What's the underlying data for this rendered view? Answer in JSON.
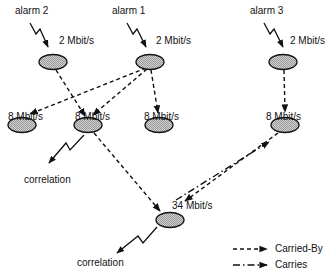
{
  "diagram": {
    "type": "network-alarm-correlation",
    "nodes": [
      {
        "id": "n2a",
        "label": "2 Mbit/s",
        "alarm": "alarm 2",
        "cx": 53,
        "cy": 62
      },
      {
        "id": "n2b",
        "label": "2 Mbit/s",
        "alarm": "alarm 1",
        "cx": 150,
        "cy": 62
      },
      {
        "id": "n2c",
        "label": "2 Mbit/s",
        "alarm": "alarm 3",
        "cx": 283,
        "cy": 62
      },
      {
        "id": "n8a",
        "label": "8 Mbit/s",
        "cx": 22,
        "cy": 125
      },
      {
        "id": "n8b",
        "label": "8 Mbit/s",
        "cx": 88,
        "cy": 125
      },
      {
        "id": "n8c",
        "label": "8 Mbit/s",
        "cx": 159,
        "cy": 125
      },
      {
        "id": "n8d",
        "label": "8 Mbit/s",
        "cx": 285,
        "cy": 125
      },
      {
        "id": "n34",
        "label": "34 Mbit/s",
        "cx": 170,
        "cy": 220
      }
    ],
    "alarms": [
      {
        "label": "alarm 2",
        "target": "n2a"
      },
      {
        "label": "alarm 1",
        "target": "n2b"
      },
      {
        "label": "alarm 3",
        "target": "n2c"
      }
    ],
    "correlations": [
      {
        "label": "correlation",
        "source": "n8b"
      },
      {
        "label": "correlation",
        "source": "n34"
      }
    ],
    "edges": [
      {
        "from": "n2a",
        "to": "n8b",
        "type": "Carried-By"
      },
      {
        "from": "n2b",
        "to": "n8a",
        "type": "Carried-By"
      },
      {
        "from": "n2b",
        "to": "n8b",
        "type": "Carried-By"
      },
      {
        "from": "n2b",
        "to": "n8c",
        "type": "Carried-By"
      },
      {
        "from": "n2c",
        "to": "n8d",
        "type": "Carried-By"
      },
      {
        "from": "n8b",
        "to": "n34",
        "type": "Carried-By"
      },
      {
        "from": "n8d",
        "to": "n34",
        "type": "Carried-By"
      },
      {
        "from": "n34",
        "to": "n8d",
        "type": "Carries"
      }
    ]
  },
  "labels": {
    "alarm1": "alarm 1",
    "alarm2": "alarm 2",
    "alarm3": "alarm 3",
    "rate_2a": "2 Mbit/s",
    "rate_2b": "2 Mbit/s",
    "rate_2c": "2 Mbit/s",
    "rate_8a": "8 Mbit/s",
    "rate_8b": "8 Mbit/s",
    "rate_8c": "8 Mbit/s",
    "rate_8d": "8 Mbit/s",
    "rate_34": "34 Mbit/s",
    "correlation1": "correlation",
    "correlation2": "correlation"
  },
  "legend": {
    "carried_by": "Carried-By",
    "carries": "Carries"
  },
  "colors": {
    "node_fill": "#c8c8c8",
    "stroke": "#111111"
  }
}
